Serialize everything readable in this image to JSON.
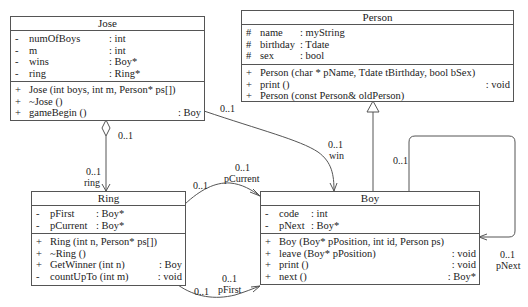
{
  "classes": {
    "jose": {
      "name": "Jose",
      "attributes": [
        {
          "vis": "-",
          "name": "numOfBoys",
          "type": ": int"
        },
        {
          "vis": "-",
          "name": "m",
          "type": ": int"
        },
        {
          "vis": "-",
          "name": "wins",
          "type": ": Boy*"
        },
        {
          "vis": "-",
          "name": "ring",
          "type": ": Ring*"
        }
      ],
      "operations": [
        {
          "vis": "+",
          "sig": "Jose (int boys, int m, Person* ps[])",
          "ret": ""
        },
        {
          "vis": "+",
          "sig": "~Jose ()",
          "ret": ""
        },
        {
          "vis": "+",
          "sig": "gameBegin ()",
          "ret": ": Boy"
        }
      ]
    },
    "person": {
      "name": "Person",
      "attributes": [
        {
          "vis": "#",
          "name": "name",
          "type": ": myString"
        },
        {
          "vis": "#",
          "name": "birthday",
          "type": ": Tdate"
        },
        {
          "vis": "#",
          "name": "sex",
          "type": ": bool"
        }
      ],
      "operations": [
        {
          "vis": "+",
          "sig": "Person (char * pName, Tdate tBirthday, bool bSex)",
          "ret": ""
        },
        {
          "vis": "+",
          "sig": "print ()",
          "ret": ": void"
        },
        {
          "vis": "+",
          "sig": "Person (const Person& oldPerson)",
          "ret": ""
        }
      ]
    },
    "ring": {
      "name": "Ring",
      "attributes": [
        {
          "vis": "-",
          "name": "pFirst",
          "type": ": Boy*"
        },
        {
          "vis": "-",
          "name": "pCurrent",
          "type": ": Boy*"
        }
      ],
      "operations": [
        {
          "vis": "+",
          "sig": "Ring (int n, Person* ps[])",
          "ret": ""
        },
        {
          "vis": "+",
          "sig": "~Ring ()",
          "ret": ""
        },
        {
          "vis": "+",
          "sig": "GetWinner (int n)",
          "ret": ": Boy"
        },
        {
          "vis": "-",
          "sig": "countUpTo (int m)",
          "ret": ": void"
        }
      ]
    },
    "boy": {
      "name": "Boy",
      "attributes": [
        {
          "vis": "-",
          "name": "code",
          "type": ": int"
        },
        {
          "vis": "-",
          "name": "pNext",
          "type": ": Boy*"
        }
      ],
      "operations": [
        {
          "vis": "+",
          "sig": "Boy (Boy* pPosition, int id, Person ps)",
          "ret": ""
        },
        {
          "vis": "+",
          "sig": "leave (Boy* pPosition)",
          "ret": ": void"
        },
        {
          "vis": "+",
          "sig": "print ()",
          "ret": ": void"
        },
        {
          "vis": "+",
          "sig": "next ()",
          "ret": ": Boy*"
        }
      ]
    }
  },
  "associations": {
    "jose_ring": {
      "source_mult": "0..1",
      "target_mult": "0..1",
      "target_role": "ring"
    },
    "jose_boy": {
      "source_mult": "0..1",
      "target_mult": "0..1",
      "target_role": "win"
    },
    "ring_boy_current": {
      "source_mult": "0..1",
      "target_mult": "0..1",
      "target_role": "pCurrent"
    },
    "ring_boy_first": {
      "source_mult": "0..1",
      "target_mult": "0..1",
      "target_role": "pFirst"
    },
    "boy_self": {
      "source_mult": "0..1",
      "target_mult": "0..1",
      "target_role": "pNext"
    }
  },
  "colors": {
    "line": "#555555",
    "text": "#222222",
    "background": "#ffffff"
  }
}
